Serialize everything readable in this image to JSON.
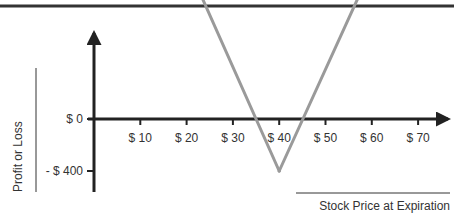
{
  "chart_data": {
    "type": "line",
    "title": "",
    "xlabel": "Stock Price at Expiration",
    "ylabel": "Profit or Loss",
    "x_ticks": [
      {
        "value": 10,
        "label": "$ 10"
      },
      {
        "value": 20,
        "label": "$ 20"
      },
      {
        "value": 30,
        "label": "$ 30"
      },
      {
        "value": 40,
        "label": "$ 40"
      },
      {
        "value": 50,
        "label": "$ 50"
      },
      {
        "value": 60,
        "label": "$ 60"
      },
      {
        "value": 70,
        "label": "$ 70"
      }
    ],
    "y_ticks": [
      {
        "value": 0,
        "label": "$ 0"
      },
      {
        "value": -400,
        "label": "- $ 400"
      }
    ],
    "xlim": [
      0,
      77
    ],
    "ylim": [
      -530,
      1140
    ],
    "grid": false,
    "legend": "none",
    "series": [
      {
        "name": "Long straddle payoff",
        "color": "#9a9a9a",
        "points": [
          {
            "x": 21.5,
            "y": 1080
          },
          {
            "x": 40,
            "y": -400
          },
          {
            "x": 58.8,
            "y": 1070
          }
        ],
        "arrow_ends": true
      }
    ],
    "break_even_points": [
      33.5,
      47
    ]
  },
  "colors": {
    "axis": "#222222",
    "rule": "#333333",
    "payoff_line": "#9a9a9a",
    "text": "#333333"
  }
}
